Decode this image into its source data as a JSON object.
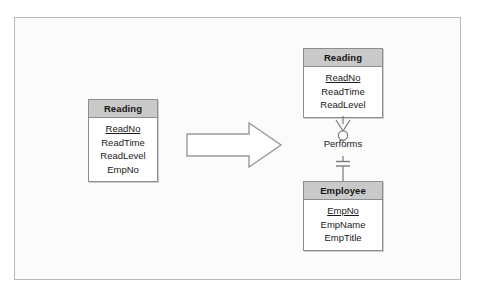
{
  "diagram": {
    "frame_border_color": "#b9b9b9",
    "entity_header_color": "#c9c9c9",
    "entity_border_color": "#8d8d8d",
    "arrow_fill_color": "#ffffff",
    "arrow_outline_color": "#9a9a9a"
  },
  "source_entity": {
    "name": "Reading",
    "attributes": [
      {
        "label": "ReadNo",
        "key": true
      },
      {
        "label": "ReadTime",
        "key": false
      },
      {
        "label": "ReadLevel",
        "key": false
      },
      {
        "label": "EmpNo",
        "key": false
      }
    ]
  },
  "transform": {
    "icon": "right-block-arrow"
  },
  "result_entities": [
    {
      "name": "Reading",
      "attributes": [
        {
          "label": "ReadNo",
          "key": true
        },
        {
          "label": "ReadTime",
          "key": false
        },
        {
          "label": "ReadLevel",
          "key": false
        }
      ]
    },
    {
      "name": "Employee",
      "attributes": [
        {
          "label": "EmpNo",
          "key": true
        },
        {
          "label": "EmpName",
          "key": false
        },
        {
          "label": "EmpTitle",
          "key": false
        }
      ]
    }
  ],
  "relationship": {
    "label": "Performs",
    "parent_cardinality": "one-and-only-one",
    "child_cardinality": "zero-or-many",
    "parent_symbol": "double-bar",
    "child_symbol": "crows-foot-with-circle"
  }
}
